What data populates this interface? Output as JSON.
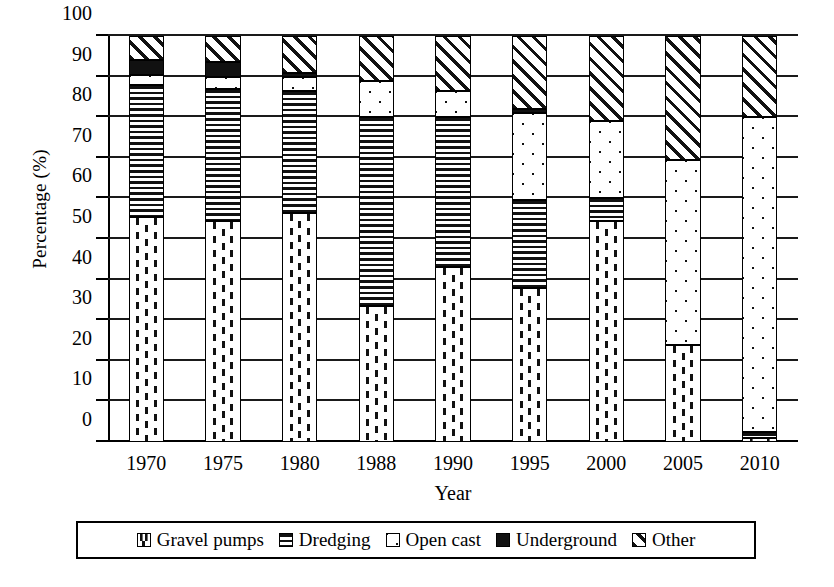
{
  "chart_data": {
    "type": "bar",
    "title": "",
    "subtitle": "",
    "stacked": true,
    "xlabel": "Year",
    "ylabel": "Percentage (%)",
    "ylim": [
      0,
      100
    ],
    "ytick_step": 10,
    "yticks": [
      0,
      10,
      20,
      30,
      40,
      50,
      60,
      70,
      80,
      90,
      100
    ],
    "ytick_labels": [
      "0",
      "10",
      "20",
      "30",
      "40",
      "50",
      "60",
      "70",
      "80",
      "90",
      "100"
    ],
    "grid": true,
    "grid_axis": "y",
    "legend_position": "bottom",
    "categories": [
      "1970",
      "1975",
      "1980",
      "1988",
      "1990",
      "1995",
      "2000",
      "2005",
      "2010"
    ],
    "series": [
      {
        "name": "Gravel pumps",
        "pattern": "vertical-dashes",
        "values": [
          55.5,
          54.5,
          56.5,
          33.5,
          43.0,
          38.0,
          54.5,
          24.0,
          1.0
        ]
      },
      {
        "name": "Dredging",
        "pattern": "horizontal-lines",
        "values": [
          32.5,
          32.5,
          30.0,
          46.5,
          37.0,
          21.5,
          5.5,
          0.0,
          1.5
        ]
      },
      {
        "name": "Open cast",
        "pattern": "dots",
        "values": [
          2.5,
          3.0,
          3.5,
          9.0,
          6.5,
          21.5,
          19.0,
          45.5,
          77.5
        ]
      },
      {
        "name": "Underground",
        "pattern": "solid-black",
        "values": [
          3.5,
          3.5,
          1.0,
          0.0,
          0.0,
          1.0,
          0.0,
          0.0,
          0.0
        ]
      },
      {
        "name": "Other",
        "pattern": "diagonal-hatch",
        "values": [
          6.0,
          6.5,
          9.0,
          11.0,
          13.5,
          18.0,
          21.0,
          30.5,
          20.0
        ]
      }
    ]
  },
  "legend": {
    "items": [
      {
        "label": "Gravel pumps",
        "pattern": "vertical-dashes"
      },
      {
        "label": "Dredging",
        "pattern": "horizontal-lines"
      },
      {
        "label": "Open cast",
        "pattern": "dots"
      },
      {
        "label": "Underground",
        "pattern": "solid-black"
      },
      {
        "label": "Other",
        "pattern": "diagonal-hatch"
      }
    ]
  },
  "colors": {
    "ink": "#111111",
    "background": "#ffffff"
  }
}
